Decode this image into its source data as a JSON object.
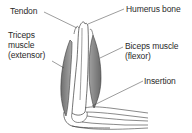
{
  "diagram": {
    "labels": {
      "tendon": "Tendon",
      "humerus": "Humerus bone",
      "triceps_line1": "Triceps",
      "triceps_line2": "muscle",
      "triceps_line3": "(extensor)",
      "biceps_line1": "Biceps muscle",
      "biceps_line2": "(flexor)",
      "insertion": "Insertion"
    },
    "colors": {
      "line": "#3a3a3a",
      "muscle_fill": "#8a8a8a",
      "text": "#2a2a2a",
      "background": "#ffffff"
    }
  }
}
